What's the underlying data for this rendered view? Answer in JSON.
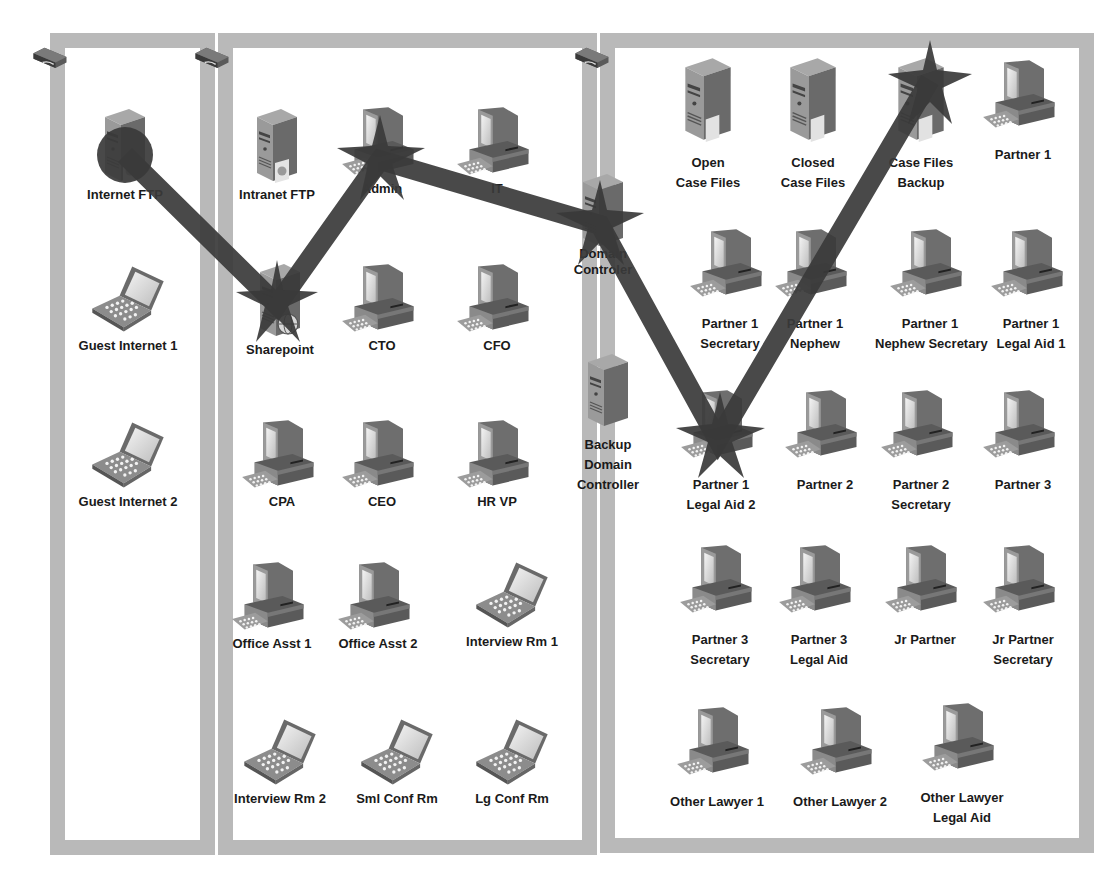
{
  "diagram": {
    "type": "network-attack-path",
    "zones": [
      {
        "id": "zone-dmz",
        "label": "",
        "nodes": [
          "Internet FTP",
          "Guest Internet 1",
          "Guest Internet 2"
        ]
      },
      {
        "id": "zone-corporate",
        "label": "",
        "nodes": [
          "Intranet FTP",
          "Admin",
          "IT",
          "Sharepoint",
          "CTO",
          "CFO",
          "CPA",
          "CEO",
          "HR VP",
          "Office Asst 1",
          "Office Asst 2",
          "Interview Rm 1",
          "Interview Rm 2",
          "Sml Conf Rm",
          "Lg Conf Rm"
        ]
      },
      {
        "id": "zone-legal",
        "label": "",
        "nodes": [
          "Domain Controler",
          "Backup Domain Controller",
          "Open Case Files",
          "Closed Case Files",
          "Case Files Backup",
          "Partner 1",
          "Partner 1 Secretary",
          "Partner 1 Nephew",
          "Partner 1 Nephew Secretary",
          "Partner 1 Legal Aid 1",
          "Partner 1 Legal Aid 2",
          "Partner 2",
          "Partner 2 Secretary",
          "Partner 3",
          "Partner 3 Secretary",
          "Partner 3 Legal Aid",
          "Jr Partner",
          "Jr Partner Secretary",
          "Other Lawyer 1",
          "Other Lawyer 2",
          "Other Lawyer Legal Aid"
        ]
      }
    ],
    "nodes": {
      "internet_ftp": {
        "line1": "Internet FTP",
        "line2": "",
        "icon": "server-icon"
      },
      "guest_internet_1": {
        "line1": "Guest Internet 1",
        "line2": "",
        "icon": "laptop-icon"
      },
      "guest_internet_2": {
        "line1": "Guest Internet 2",
        "line2": "",
        "icon": "laptop-icon"
      },
      "intranet_ftp": {
        "line1": "Intranet FTP",
        "line2": "",
        "icon": "server-icon"
      },
      "admin": {
        "line1": "Admin",
        "line2": "",
        "icon": "desktop-icon"
      },
      "it": {
        "line1": "IT",
        "line2": "",
        "icon": "desktop-icon"
      },
      "sharepoint": {
        "line1": "Sharepoint",
        "line2": "",
        "icon": "web-server-icon"
      },
      "cto": {
        "line1": "CTO",
        "line2": "",
        "icon": "desktop-icon"
      },
      "cfo": {
        "line1": "CFO",
        "line2": "",
        "icon": "desktop-icon"
      },
      "cpa": {
        "line1": "CPA",
        "line2": "",
        "icon": "desktop-icon"
      },
      "ceo": {
        "line1": "CEO",
        "line2": "",
        "icon": "desktop-icon"
      },
      "hr_vp": {
        "line1": "HR VP",
        "line2": "",
        "icon": "desktop-icon"
      },
      "office_asst_1": {
        "line1": "Office Asst 1",
        "line2": "",
        "icon": "desktop-icon"
      },
      "office_asst_2": {
        "line1": "Office Asst 2",
        "line2": "",
        "icon": "desktop-icon"
      },
      "interview_rm_1": {
        "line1": "Interview Rm 1",
        "line2": "",
        "icon": "laptop-icon"
      },
      "interview_rm_2": {
        "line1": "Interview Rm 2",
        "line2": "",
        "icon": "laptop-icon"
      },
      "sml_conf_rm": {
        "line1": "Sml Conf Rm",
        "line2": "",
        "icon": "laptop-icon"
      },
      "lg_conf_rm": {
        "line1": "Lg Conf Rm",
        "line2": "",
        "icon": "laptop-icon"
      },
      "domain_controller": {
        "line1": "Domain",
        "line2": "Controler",
        "icon": "server-icon"
      },
      "backup_domain_controller": {
        "line1": "Backup",
        "line2": "Domain",
        "line3": "Controller",
        "icon": "server-icon"
      },
      "open_case_files": {
        "line1": "Open",
        "line2": "Case Files",
        "icon": "file-server-icon"
      },
      "closed_case_files": {
        "line1": "Closed",
        "line2": "Case Files",
        "icon": "file-server-icon"
      },
      "case_files_backup": {
        "line1": "Case Files",
        "line2": "Backup",
        "icon": "file-server-icon"
      },
      "partner_1": {
        "line1": "Partner 1",
        "line2": "",
        "icon": "desktop-icon"
      },
      "partner_1_secretary": {
        "line1": "Partner 1",
        "line2": "Secretary",
        "icon": "desktop-icon"
      },
      "partner_1_nephew": {
        "line1": "Partner 1",
        "line2": "Nephew",
        "icon": "desktop-icon"
      },
      "partner_1_nephew_secretary": {
        "line1": "Partner 1",
        "line2": "Nephew Secretary",
        "icon": "desktop-icon"
      },
      "partner_1_legal_aid_1": {
        "line1": "Partner 1",
        "line2": "Legal Aid 1",
        "icon": "desktop-icon"
      },
      "partner_1_legal_aid_2": {
        "line1": "Partner 1",
        "line2": "Legal Aid 2",
        "icon": "desktop-icon"
      },
      "partner_2": {
        "line1": "Partner 2",
        "line2": "",
        "icon": "desktop-icon"
      },
      "partner_2_secretary": {
        "line1": "Partner 2",
        "line2": "Secretary",
        "icon": "desktop-icon"
      },
      "partner_3": {
        "line1": "Partner 3",
        "line2": "",
        "icon": "desktop-icon"
      },
      "partner_3_secretary": {
        "line1": "Partner 3",
        "line2": "Secretary",
        "icon": "desktop-icon"
      },
      "partner_3_legal_aid": {
        "line1": "Partner 3",
        "line2": "Legal Aid",
        "icon": "desktop-icon"
      },
      "jr_partner": {
        "line1": "Jr Partner",
        "line2": "",
        "icon": "desktop-icon"
      },
      "jr_partner_secretary": {
        "line1": "Jr Partner",
        "line2": "Secretary",
        "icon": "desktop-icon"
      },
      "other_lawyer_1": {
        "line1": "Other Lawyer 1",
        "line2": "",
        "icon": "desktop-icon"
      },
      "other_lawyer_2": {
        "line1": "Other Lawyer 2",
        "line2": "",
        "icon": "desktop-icon"
      },
      "other_lawyer_legal_aid": {
        "line1": "Other Lawyer",
        "line2": "Legal Aid",
        "icon": "desktop-icon"
      }
    },
    "attack_path": [
      "Internet FTP",
      "Sharepoint",
      "Admin",
      "Domain Controler",
      "Partner 1 Legal Aid 2",
      "Case Files Backup"
    ],
    "colors": {
      "zone_border": "#b9b9b9",
      "attack_path": "#3a3a3a",
      "label": "#1a1a1a"
    }
  }
}
